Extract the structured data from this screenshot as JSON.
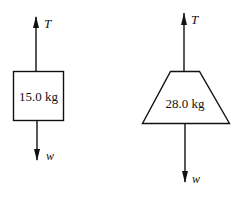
{
  "diagram": {
    "type": "free-body-diagrams",
    "objects": [
      {
        "shape": "rectangle",
        "mass_label": "15.0 kg",
        "forces": [
          {
            "symbol": "T",
            "direction": "up"
          },
          {
            "symbol": "w",
            "direction": "down"
          }
        ]
      },
      {
        "shape": "trapezoid",
        "mass_label": "28.0 kg",
        "forces": [
          {
            "symbol": "T",
            "direction": "up"
          },
          {
            "symbol": "w",
            "direction": "down"
          }
        ]
      }
    ],
    "colors": {
      "stroke": "#111111",
      "background": "#ffffff"
    }
  }
}
